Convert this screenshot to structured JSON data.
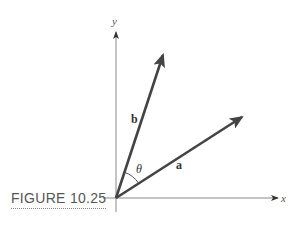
{
  "figure": {
    "caption": "FIGURE 10.25",
    "axes": {
      "x_label": "x",
      "y_label": "y"
    },
    "vectors": [
      {
        "name": "a",
        "label": "a"
      },
      {
        "name": "b",
        "label": "b"
      }
    ],
    "angle_label": "θ",
    "colors": {
      "vector": "#444444",
      "axis": "#888888",
      "text": "#333333",
      "caption": "#555555"
    }
  }
}
